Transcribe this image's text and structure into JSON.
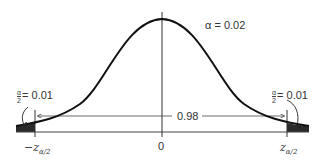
{
  "diagram": {
    "type": "normal-distribution-two-tailed",
    "alpha_label": "α = 0.02",
    "left_tail": {
      "numerator": "α",
      "denominator": "2",
      "value": "= 0.01"
    },
    "right_tail": {
      "numerator": "α",
      "denominator": "2",
      "value": "= 0.01"
    },
    "middle_area": "0.98",
    "axis_labels": {
      "left": {
        "prefix": "−z",
        "subscript": "α/2"
      },
      "center": "0",
      "right": {
        "prefix": "z",
        "subscript": "α/2"
      }
    },
    "colors": {
      "curve": "#111111",
      "shade": "#2a2a2a",
      "lines": "#444444"
    }
  }
}
